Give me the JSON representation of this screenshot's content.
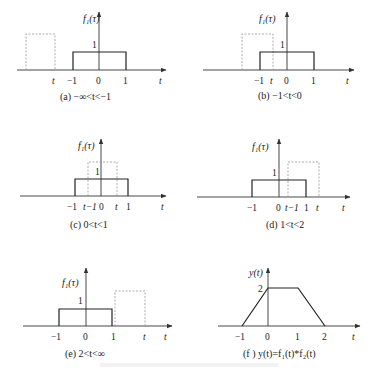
{
  "figure": {
    "caption": "",
    "panels": [
      {
        "id": "a",
        "ylabel": "f₁(τ)",
        "level_label": "1",
        "ticks": [
          "t",
          "−1",
          "0",
          "1"
        ],
        "axis_label": "t",
        "caption": "(a)  −∞<t<−1"
      },
      {
        "id": "b",
        "ylabel": "f₁(τ)",
        "level_label": "1",
        "ticks": [
          "−1",
          "t",
          "0",
          "1"
        ],
        "axis_label": "t",
        "caption": "(b)  −1<t<0"
      },
      {
        "id": "c",
        "ylabel": "f₁(τ)",
        "level_label": "1",
        "ticks": [
          "−1",
          "t−1",
          "0",
          "t",
          "1"
        ],
        "axis_label": "t",
        "caption": "(c)  0<t<1"
      },
      {
        "id": "d",
        "ylabel": "f₁(τ)",
        "level_label": "1",
        "ticks": [
          "−1",
          "0",
          "t−1",
          "1",
          "t"
        ],
        "axis_label": "t",
        "caption": "(d)  1<t<2"
      },
      {
        "id": "e",
        "ylabel": "f₁(τ)",
        "level_label": "1",
        "ticks": [
          "−1",
          "0",
          "1",
          "t"
        ],
        "axis_label": "t",
        "caption": "(e)  2<t<∞"
      },
      {
        "id": "f",
        "ylabel": "y(t)",
        "level_label": "2",
        "ticks": [
          "−1",
          "0",
          "1",
          "2"
        ],
        "axis_label": "t",
        "caption": "(f ) y(t)=f₁(t)*f₂(t)"
      }
    ]
  }
}
